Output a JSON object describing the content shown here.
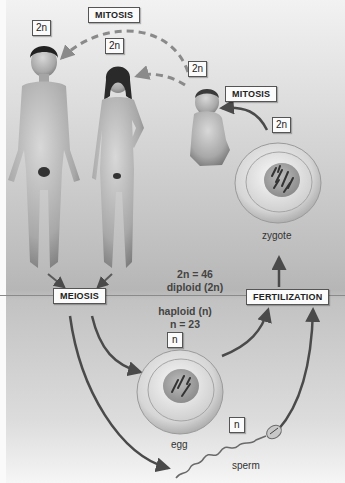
{
  "diagram": {
    "colors": {
      "background_top": "#f2f2f2",
      "background_middle": "#bdbdbd",
      "label_box": "#fbfbfb",
      "arrow": "#555555",
      "dashed_arrow": "#8a8a8a"
    },
    "figures": {
      "man": {
        "ploidy": "2n"
      },
      "woman": {
        "ploidy": "2n"
      },
      "baby": {
        "ploidy": "2n"
      },
      "zygote": {
        "ploidy": "2n",
        "caption": "zygote"
      },
      "egg": {
        "ploidy": "n",
        "caption": "egg"
      },
      "sperm": {
        "ploidy": "n",
        "caption": "sperm"
      }
    },
    "processes": {
      "mitosis_top": "MITOSIS",
      "mitosis_zygote": "MITOSIS",
      "meiosis": "MEIOSIS",
      "fertilization": "FERTILIZATION"
    },
    "regions": {
      "diploid": {
        "line1": "2n = 46",
        "line2": "diploid (2n)"
      },
      "haploid": {
        "line1": "haploid (n)",
        "line2": "n = 23"
      }
    }
  }
}
